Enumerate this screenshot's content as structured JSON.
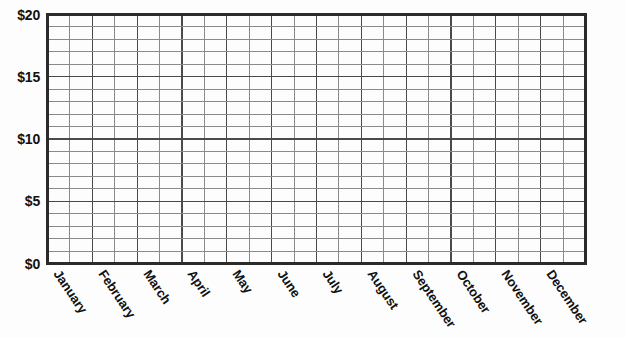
{
  "chart_data": {
    "type": "bar",
    "title": "",
    "subtitle": "",
    "xlabel": "",
    "ylabel": "",
    "categories": [
      "January",
      "February",
      "March",
      "April",
      "May",
      "June",
      "July",
      "August",
      "September",
      "October",
      "November",
      "December"
    ],
    "values": [
      null,
      null,
      null,
      null,
      null,
      null,
      null,
      null,
      null,
      null,
      null,
      null
    ],
    "series": [],
    "ylim": [
      0,
      20
    ],
    "y_tick_values": [
      0,
      5,
      10,
      15,
      20
    ],
    "y_tick_labels": [
      "$0",
      "$5",
      "$10",
      "$15",
      "$20"
    ],
    "grid": true,
    "grid_rows": 20,
    "grid_columns": 24,
    "columns_per_category": 2,
    "legend": "none"
  },
  "axes": {
    "y": {
      "ticks": [
        {
          "label": "$20",
          "value": 20
        },
        {
          "label": "$15",
          "value": 15
        },
        {
          "label": "$10",
          "value": 10
        },
        {
          "label": "$5",
          "value": 5
        },
        {
          "label": "$0",
          "value": 0
        }
      ]
    },
    "x": {
      "ticks": [
        {
          "label": "January"
        },
        {
          "label": "February"
        },
        {
          "label": "March"
        },
        {
          "label": "April"
        },
        {
          "label": "May"
        },
        {
          "label": "June"
        },
        {
          "label": "July"
        },
        {
          "label": "August"
        },
        {
          "label": "September"
        },
        {
          "label": "October"
        },
        {
          "label": "November"
        },
        {
          "label": "December"
        }
      ]
    }
  },
  "colors": {
    "background": "#fdfdfd",
    "axis": "#2b2b2b",
    "grid_major": "#4a4a4a",
    "grid_minor": "#8a8a8a",
    "text": "#111111"
  }
}
